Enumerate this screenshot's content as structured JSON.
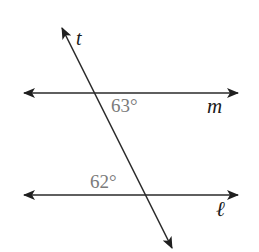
{
  "diagram": {
    "lines": [
      {
        "name": "m",
        "label": "m",
        "y": 93,
        "x1": 24,
        "x2": 238
      },
      {
        "name": "l",
        "label": "ℓ",
        "y": 195,
        "x1": 24,
        "x2": 238
      }
    ],
    "transversal": {
      "name": "t",
      "label": "t",
      "x1": 62,
      "y1": 28,
      "x2": 172,
      "y2": 248
    },
    "angles": [
      {
        "label": "63°",
        "line": "m",
        "position": "below-right of intersection"
      },
      {
        "label": "62°",
        "line": "l",
        "position": "above-left of intersection"
      }
    ],
    "colors": {
      "line": "#2a2a2a",
      "angle_text": "#7a7a7a",
      "label_text": "#1a1a1a"
    }
  }
}
